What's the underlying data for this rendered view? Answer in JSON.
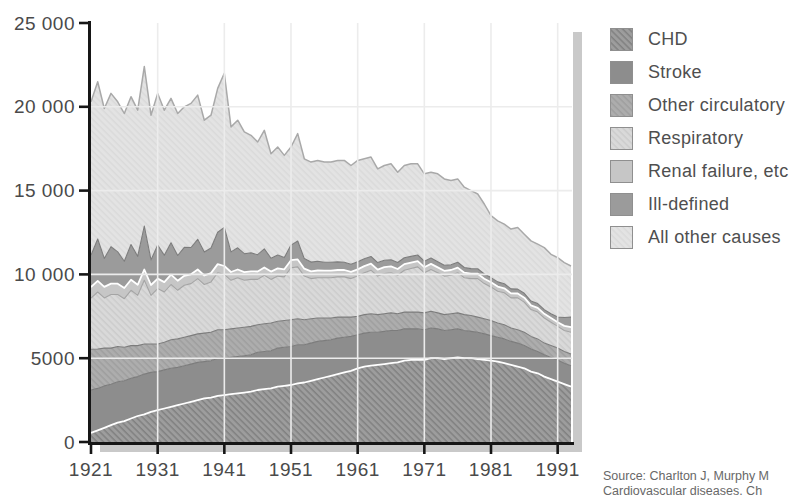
{
  "chart_data": {
    "type": "area",
    "stacked": true,
    "title": "",
    "grid": true,
    "legend_position": "right",
    "ylim": [
      0,
      25000
    ],
    "y_ticks": [
      0,
      5000,
      10000,
      15000,
      20000,
      25000
    ],
    "y_tick_labels": [
      "0",
      "5000",
      "10 000",
      "15 000",
      "20 000",
      "25 000"
    ],
    "x_ticks": [
      "1921",
      "1931",
      "1941",
      "1951",
      "1961",
      "1971",
      "1981",
      "1991"
    ],
    "years": [
      1921,
      1922,
      1923,
      1924,
      1925,
      1926,
      1927,
      1928,
      1929,
      1930,
      1931,
      1932,
      1933,
      1934,
      1935,
      1936,
      1937,
      1938,
      1939,
      1940,
      1941,
      1942,
      1943,
      1944,
      1945,
      1946,
      1947,
      1948,
      1949,
      1950,
      1951,
      1952,
      1953,
      1954,
      1955,
      1956,
      1957,
      1958,
      1959,
      1960,
      1961,
      1962,
      1963,
      1964,
      1965,
      1966,
      1967,
      1968,
      1969,
      1970,
      1971,
      1972,
      1973,
      1974,
      1975,
      1976,
      1977,
      1978,
      1979,
      1980,
      1981,
      1982,
      1983,
      1984,
      1985,
      1986,
      1987,
      1988,
      1989,
      1990,
      1991,
      1992,
      1993
    ],
    "series": [
      {
        "name": "CHD",
        "color": "#9d9d9d",
        "hatch": true,
        "hatch_color": "#818181",
        "edge": "#ffffff",
        "values": [
          550,
          700,
          850,
          1000,
          1150,
          1250,
          1400,
          1550,
          1650,
          1800,
          1900,
          2000,
          2100,
          2200,
          2300,
          2400,
          2500,
          2600,
          2650,
          2750,
          2800,
          2850,
          2900,
          2950,
          3000,
          3100,
          3150,
          3200,
          3300,
          3350,
          3400,
          3500,
          3550,
          3650,
          3750,
          3850,
          3950,
          4050,
          4150,
          4250,
          4400,
          4500,
          4550,
          4600,
          4650,
          4700,
          4750,
          4850,
          4900,
          4900,
          4900,
          5000,
          5000,
          4950,
          5000,
          5050,
          5000,
          5000,
          4950,
          4900,
          4850,
          4800,
          4700,
          4600,
          4500,
          4400,
          4200,
          4100,
          3900,
          3750,
          3600,
          3450,
          3300
        ]
      },
      {
        "name": "Stroke",
        "color": "#8d8d8d",
        "hatch": false,
        "hatch_color": "",
        "edge": "#7c7c7c",
        "values": [
          2550,
          2500,
          2500,
          2450,
          2450,
          2400,
          2400,
          2350,
          2400,
          2350,
          2300,
          2300,
          2300,
          2250,
          2250,
          2250,
          2250,
          2200,
          2200,
          2250,
          2200,
          2200,
          2200,
          2200,
          2200,
          2250,
          2250,
          2250,
          2300,
          2300,
          2300,
          2300,
          2250,
          2250,
          2250,
          2200,
          2150,
          2150,
          2100,
          2050,
          2000,
          2000,
          2000,
          1950,
          1950,
          1950,
          1900,
          1900,
          1850,
          1850,
          1800,
          1800,
          1750,
          1700,
          1700,
          1700,
          1650,
          1600,
          1600,
          1550,
          1500,
          1450,
          1450,
          1400,
          1400,
          1350,
          1350,
          1300,
          1300,
          1300,
          1300,
          1250,
          1250
        ]
      },
      {
        "name": "Other circulatory",
        "color": "#adadad",
        "hatch": true,
        "hatch_color": "#9f9f9f",
        "edge": "#7c7c7c",
        "values": [
          2430,
          2350,
          2250,
          2150,
          2100,
          2000,
          1950,
          1850,
          1800,
          1700,
          1650,
          1650,
          1700,
          1700,
          1700,
          1700,
          1700,
          1700,
          1700,
          1700,
          1700,
          1700,
          1700,
          1700,
          1700,
          1650,
          1650,
          1650,
          1600,
          1600,
          1600,
          1550,
          1500,
          1450,
          1400,
          1350,
          1300,
          1250,
          1200,
          1150,
          1100,
          1100,
          1100,
          1050,
          1050,
          1050,
          1000,
          1000,
          1000,
          1000,
          1000,
          1000,
          950,
          950,
          950,
          950,
          950,
          950,
          900,
          900,
          900,
          850,
          850,
          800,
          800,
          800,
          750,
          750,
          700,
          700,
          700,
          700,
          700
        ]
      },
      {
        "name": "Respiratory",
        "color": "#d9d9d9",
        "hatch": true,
        "hatch_color": "#cccccc",
        "edge": "#a4a4a4",
        "values": [
          3050,
          3400,
          3000,
          3200,
          3100,
          2900,
          3300,
          3000,
          3800,
          2900,
          3300,
          3000,
          3300,
          2900,
          3100,
          3100,
          3300,
          2900,
          3000,
          3400,
          3300,
          2900,
          3000,
          2800,
          2800,
          2700,
          2900,
          2600,
          2700,
          2600,
          3100,
          3100,
          2600,
          2400,
          2400,
          2400,
          2400,
          2400,
          2400,
          2300,
          2400,
          2500,
          2600,
          2300,
          2400,
          2400,
          2300,
          2500,
          2600,
          2700,
          2400,
          2500,
          2400,
          2300,
          2300,
          2400,
          2200,
          2200,
          2300,
          2100,
          2000,
          1900,
          1900,
          1800,
          1900,
          1800,
          1600,
          1600,
          1500,
          1400,
          1300,
          1250,
          1300
        ]
      },
      {
        "name": "Renal failure, etc",
        "color": "#c6c6c6",
        "hatch": false,
        "hatch_color": "",
        "edge": "#ffffff",
        "values": [
          670,
          660,
          655,
          650,
          645,
          640,
          635,
          630,
          640,
          615,
          600,
          590,
          585,
          575,
          565,
          555,
          545,
          535,
          525,
          515,
          500,
          495,
          490,
          485,
          480,
          475,
          470,
          465,
          460,
          455,
          450,
          445,
          440,
          435,
          430,
          425,
          420,
          415,
          410,
          405,
          400,
          395,
          390,
          385,
          380,
          375,
          370,
          365,
          355,
          340,
          330,
          325,
          320,
          315,
          310,
          305,
          300,
          295,
          290,
          285,
          280,
          275,
          270,
          265,
          260,
          260,
          255,
          255,
          250,
          250,
          250,
          280,
          300
        ]
      },
      {
        "name": "Ill-defined",
        "color": "#9b9b9b",
        "hatch": false,
        "hatch_color": "",
        "edge": "#7c7c7c",
        "values": [
          1900,
          2500,
          1700,
          2200,
          1900,
          1600,
          2100,
          1700,
          2600,
          1500,
          2000,
          1600,
          1900,
          1500,
          1700,
          1600,
          1800,
          1400,
          1500,
          1900,
          2300,
          1200,
          1300,
          1100,
          1100,
          1000,
          1100,
          800,
          800,
          700,
          900,
          1100,
          600,
          550,
          550,
          500,
          500,
          480,
          470,
          450,
          450,
          440,
          430,
          420,
          410,
          400,
          390,
          380,
          370,
          370,
          360,
          350,
          340,
          330,
          320,
          320,
          310,
          300,
          300,
          290,
          280,
          280,
          270,
          270,
          260,
          260,
          250,
          250,
          250,
          250,
          300,
          500,
          600
        ]
      },
      {
        "name": "All other causes",
        "color": "#e3e3e3",
        "hatch": true,
        "hatch_color": "#dadada",
        "edge": "#a9a9a9",
        "values": [
          9150,
          9390,
          8945,
          9150,
          8955,
          8810,
          8815,
          8720,
          9510,
          8635,
          9050,
          8660,
          8615,
          8475,
          8385,
          8595,
          8605,
          7865,
          7925,
          8585,
          9200,
          7455,
          7610,
          7265,
          7020,
          6725,
          7080,
          6235,
          6440,
          6095,
          5850,
          6405,
          5960,
          5965,
          6020,
          5975,
          5980,
          6055,
          6070,
          5895,
          6050,
          5965,
          5930,
          5595,
          5660,
          5725,
          5390,
          5505,
          5525,
          5440,
          5210,
          5125,
          5240,
          5155,
          5020,
          4975,
          4790,
          4655,
          4460,
          4175,
          3690,
          3645,
          3560,
          3565,
          3680,
          3530,
          3595,
          3545,
          3700,
          3550,
          3550,
          3270,
          3050
        ]
      }
    ]
  },
  "style_colors": {
    "axis": "#161616",
    "tick_label": "#4a4a4a",
    "gridline": "#ececec",
    "shadow": "#c9c9c9",
    "legend_text": "#4f4f4f"
  },
  "source": {
    "line1": "Source: Charlton J, Murphy M",
    "line2": "Cardiovascular diseases. Ch"
  }
}
